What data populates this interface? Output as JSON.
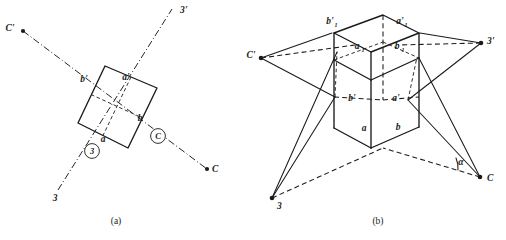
{
  "figure": {
    "caption_a": "(a)",
    "caption_b": "(b)",
    "panel_a": {
      "name": "top-view-projection",
      "axis_labels": {
        "c_prime": "C'",
        "three_prime": "3'",
        "three": "3",
        "c": "C"
      },
      "circled_markers": [
        {
          "label": "3",
          "meaning": "circled-three-marker"
        },
        {
          "label": "C",
          "meaning": "circled-c-marker"
        }
      ],
      "square_vertex_labels": {
        "b_prime": "b'",
        "a_prime": "a'",
        "a": "a",
        "b": "b"
      }
    },
    "panel_b": {
      "name": "isometric-block-projection",
      "outer_points": {
        "c_prime": "C'",
        "three_prime": "3'",
        "three": "3",
        "c": "C"
      },
      "angle_label": "α",
      "top_labels": {
        "b1_prime": "b'",
        "b1_prime_sub": "1",
        "a1_prime": "a'",
        "a1_prime_sub": "1"
      },
      "inner_top_labels": {
        "a1": "a",
        "a1_sub": "1",
        "b1": "b",
        "b1_sub": "1"
      },
      "mid_labels": {
        "b_prime": "b'",
        "a_prime": "a'"
      },
      "bottom_labels": {
        "a": "a",
        "b": "b"
      }
    },
    "colors": {
      "ink": "#1a1a1a",
      "paper": "#ffffff"
    }
  }
}
